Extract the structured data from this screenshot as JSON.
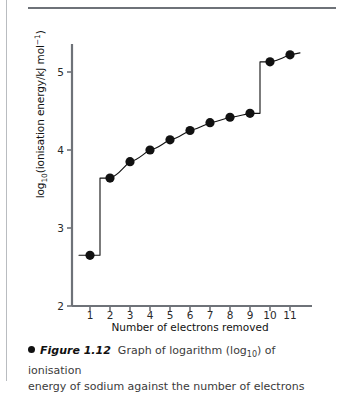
{
  "figure": {
    "number": "Figure 1.12",
    "bullet": "bullet-icon",
    "caption_part1": "Graph of logarithm (log",
    "caption_sub": "10",
    "caption_part2": ") of ionisation",
    "caption_line2": "energy of sodium against the number of electrons"
  },
  "axis": {
    "x_title": "Number of electrons removed",
    "y_title_main": "(ionisation energy/kJ mol",
    "y_title_log": "log",
    "y_title_sub": "10",
    "y_title_sup": "−1",
    "y_title_close": ")"
  },
  "colors": {
    "ink": "#111111",
    "axis": "#6e7278",
    "rule": "#b9bcc0",
    "background": "#ffffff",
    "caption": "#3b3b3b"
  },
  "chart_data": {
    "type": "scatter",
    "xlabel": "Number of electrons removed",
    "ylabel": "log10(ionisation energy/kJ mol-1)",
    "xlim": [
      0.4,
      11.6
    ],
    "ylim": [
      2,
      5.45
    ],
    "xticks": [
      1,
      2,
      3,
      4,
      5,
      6,
      7,
      8,
      9,
      10,
      11
    ],
    "yticks": [
      2,
      3,
      4,
      5
    ],
    "xtick_labels": [
      "1",
      "2",
      "3",
      "4",
      "5",
      "6",
      "7",
      "8",
      "9",
      "10",
      "11"
    ],
    "ytick_labels": [
      "2",
      "3",
      "4",
      "5"
    ],
    "grid": false,
    "legend": false,
    "marker": "filled-circle",
    "connector": "step-and-curve",
    "x": [
      1,
      2,
      3,
      4,
      5,
      6,
      7,
      8,
      9,
      10,
      11
    ],
    "values": [
      2.65,
      3.64,
      3.85,
      4.0,
      4.13,
      4.25,
      4.35,
      4.42,
      4.47,
      5.13,
      5.22
    ],
    "series": [
      {
        "name": "log10(ionisation energy) of sodium",
        "values": [
          2.65,
          3.64,
          3.85,
          4.0,
          4.13,
          4.25,
          4.35,
          4.42,
          4.47,
          5.13,
          5.22
        ]
      }
    ],
    "step_breaks": [
      1.5,
      9.5
    ],
    "annotations": []
  }
}
